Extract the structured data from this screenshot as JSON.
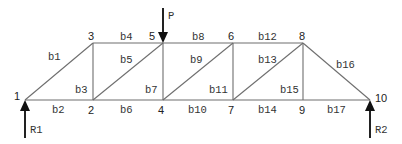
{
  "diagram": {
    "type": "truss",
    "nodes": [
      {
        "id": "1",
        "x": 25,
        "y": 100,
        "lx": 14,
        "ly": 100
      },
      {
        "id": "2",
        "x": 93,
        "y": 100,
        "lx": 88,
        "ly": 114
      },
      {
        "id": "3",
        "x": 93,
        "y": 43,
        "lx": 88,
        "ly": 40
      },
      {
        "id": "4",
        "x": 163,
        "y": 100,
        "lx": 158,
        "ly": 114
      },
      {
        "id": "5",
        "x": 163,
        "y": 43,
        "lx": 149,
        "ly": 40
      },
      {
        "id": "6",
        "x": 233,
        "y": 43,
        "lx": 228,
        "ly": 40
      },
      {
        "id": "7",
        "x": 233,
        "y": 100,
        "lx": 228,
        "ly": 114
      },
      {
        "id": "8",
        "x": 303,
        "y": 43,
        "lx": 299,
        "ly": 40
      },
      {
        "id": "9",
        "x": 303,
        "y": 100,
        "lx": 299,
        "ly": 114
      },
      {
        "id": "10",
        "x": 370,
        "y": 100,
        "lx": 375,
        "ly": 102
      }
    ],
    "members": [
      {
        "id": "b1",
        "from": "1",
        "to": "3",
        "lx": 48,
        "ly": 60
      },
      {
        "id": "b2",
        "from": "1",
        "to": "2",
        "lx": 52,
        "ly": 113
      },
      {
        "id": "b3",
        "from": "2",
        "to": "3",
        "lx": 75,
        "ly": 93
      },
      {
        "id": "b4",
        "from": "3",
        "to": "5",
        "lx": 120,
        "ly": 40
      },
      {
        "id": "b5",
        "from": "2",
        "to": "5",
        "lx": 120,
        "ly": 63
      },
      {
        "id": "b6",
        "from": "2",
        "to": "4",
        "lx": 120,
        "ly": 113
      },
      {
        "id": "b7",
        "from": "4",
        "to": "5",
        "lx": 145,
        "ly": 93
      },
      {
        "id": "b8",
        "from": "5",
        "to": "6",
        "lx": 192,
        "ly": 40
      },
      {
        "id": "b9",
        "from": "4",
        "to": "6",
        "lx": 190,
        "ly": 63
      },
      {
        "id": "b10",
        "from": "4",
        "to": "7",
        "lx": 188,
        "ly": 113
      },
      {
        "id": "b11",
        "from": "6",
        "to": "7",
        "lx": 209,
        "ly": 93
      },
      {
        "id": "b12",
        "from": "6",
        "to": "8",
        "lx": 258,
        "ly": 40
      },
      {
        "id": "b13",
        "from": "7",
        "to": "8",
        "lx": 258,
        "ly": 63
      },
      {
        "id": "b14",
        "from": "7",
        "to": "9",
        "lx": 258,
        "ly": 113
      },
      {
        "id": "b15",
        "from": "8",
        "to": "9",
        "lx": 280,
        "ly": 93
      },
      {
        "id": "b16",
        "from": "8",
        "to": "10",
        "lx": 336,
        "ly": 68
      },
      {
        "id": "b17",
        "from": "9",
        "to": "10",
        "lx": 327,
        "ly": 113
      }
    ],
    "loads": [
      {
        "id": "P",
        "label": "P",
        "node": "5",
        "direction": "down",
        "x": 163,
        "y1": 8,
        "y2": 43,
        "lx": 168,
        "ly": 19
      }
    ],
    "reactions": [
      {
        "id": "R1",
        "label": "R1",
        "node": "1",
        "direction": "up",
        "x": 25,
        "y1": 138,
        "y2": 100,
        "lx": 30,
        "ly": 133
      },
      {
        "id": "R2",
        "label": "R2",
        "node": "10",
        "direction": "up",
        "x": 370,
        "y1": 138,
        "y2": 100,
        "lx": 375,
        "ly": 133
      }
    ]
  }
}
